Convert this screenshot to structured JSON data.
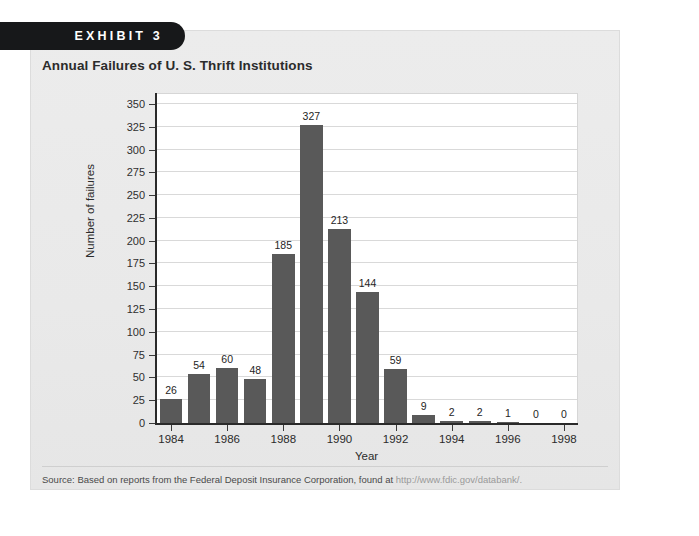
{
  "exhibit": {
    "tab_label": "EXHIBIT 3"
  },
  "chart_title": "Annual Failures of U. S. Thrift Institutions",
  "source": {
    "prefix": "Source: Based on reports from the Federal Deposit Insurance Corporation, found at ",
    "url": "http://www.fdic.gov/databank/."
  },
  "colors": {
    "bar": "#595959",
    "panel_background": "#ebebeb",
    "plot_background": "#ffffff",
    "gridline": "#d9d9d9",
    "axis": "#2a2a2a",
    "tab_background": "#17181a",
    "tab_text": "#ffffff"
  },
  "chart_data": {
    "type": "bar",
    "title": "Annual Failures of U. S. Thrift Institutions",
    "xlabel": "Year",
    "ylabel": "Number of failures",
    "ylim": [
      0,
      362
    ],
    "grid": true,
    "legend": null,
    "categories": [
      "1984",
      "1985",
      "1986",
      "1987",
      "1988",
      "1989",
      "1990",
      "1991",
      "1992",
      "1993",
      "1994",
      "1995",
      "1996",
      "1997",
      "1998"
    ],
    "values": [
      26,
      54,
      60,
      48,
      185,
      327,
      213,
      144,
      59,
      9,
      2,
      2,
      1,
      0,
      0
    ],
    "data_labels": [
      "26",
      "54",
      "60",
      "48",
      "185",
      "327",
      "213",
      "144",
      "59",
      "9",
      "2",
      "2",
      "1",
      "0",
      "0"
    ],
    "y_ticks": [
      0,
      25,
      50,
      75,
      100,
      125,
      150,
      175,
      200,
      225,
      250,
      275,
      300,
      325,
      350
    ],
    "y_tick_labels": [
      "0",
      "25",
      "50",
      "75",
      "100",
      "125",
      "150",
      "175",
      "200",
      "225",
      "250",
      "275",
      "300",
      "325",
      "350"
    ],
    "x_tick_labels": [
      "1984",
      "1986",
      "1988",
      "1990",
      "1992",
      "1994",
      "1996",
      "1998"
    ],
    "x_tick_indices": [
      0,
      2,
      4,
      6,
      8,
      10,
      12,
      14
    ]
  }
}
